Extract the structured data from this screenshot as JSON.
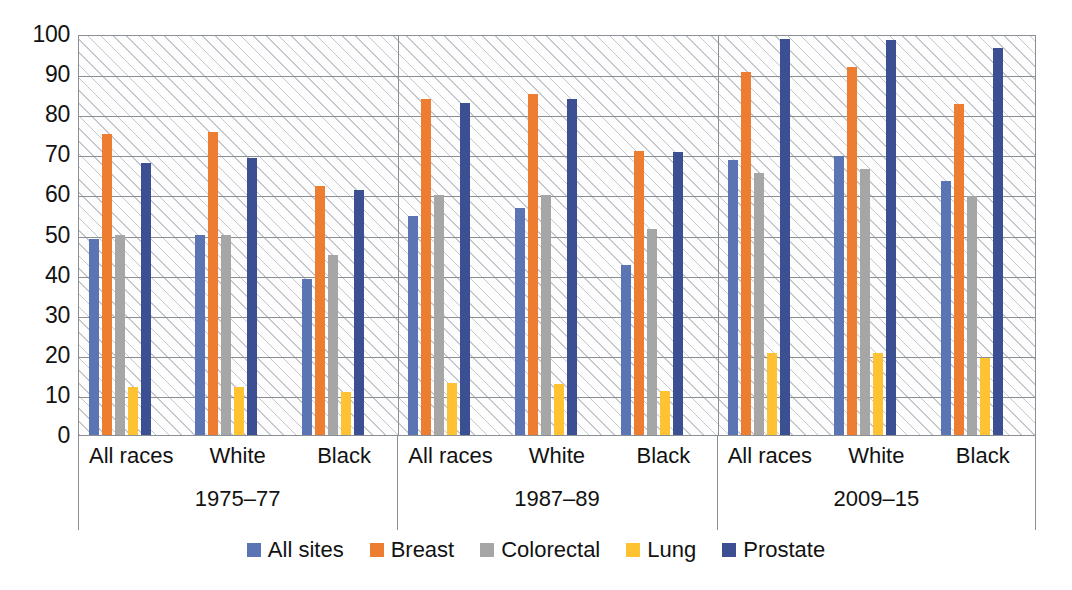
{
  "chart_data": {
    "type": "bar",
    "title": "",
    "subtitle": "",
    "xlabel": "",
    "ylabel": "",
    "ylim": [
      0,
      100
    ],
    "ytick_labels": [
      "100",
      "90",
      "80",
      "70",
      "60",
      "50",
      "40",
      "30",
      "20",
      "10",
      "0"
    ],
    "ytick_values": [
      100,
      90,
      80,
      70,
      60,
      50,
      40,
      30,
      20,
      10,
      0
    ],
    "grid": true,
    "legend_position": "bottom",
    "group_labels": [
      "1975–77",
      "1987–89",
      "2009–15"
    ],
    "categories": [
      "All races",
      "White",
      "Black",
      "All races",
      "White",
      "Black",
      "All races",
      "White",
      "Black"
    ],
    "series": [
      {
        "name": "All sites",
        "color": "#5a74b4",
        "values": [
          49.0,
          49.8,
          39.0,
          54.7,
          56.5,
          42.5,
          68.5,
          69.7,
          63.4
        ]
      },
      {
        "name": "Breast",
        "color": "#ed7d31",
        "values": [
          75.0,
          75.6,
          62.0,
          83.9,
          85.0,
          70.8,
          90.6,
          91.7,
          82.6
        ]
      },
      {
        "name": "Colorectal",
        "color": "#a6a6a6",
        "values": [
          49.8,
          49.8,
          44.9,
          59.8,
          59.9,
          51.5,
          65.4,
          66.3,
          59.6
        ]
      },
      {
        "name": "Lung",
        "color": "#ffc233",
        "values": [
          11.9,
          11.9,
          10.7,
          12.9,
          12.8,
          11.0,
          20.5,
          20.5,
          19.1
        ]
      },
      {
        "name": "Prostate",
        "color": "#3d4f93",
        "values": [
          67.8,
          69.0,
          61.0,
          82.9,
          83.9,
          70.7,
          98.8,
          98.5,
          96.4
        ]
      }
    ],
    "legend_entries": [
      {
        "label": "All sites",
        "color": "#5a74b4"
      },
      {
        "label": "Breast",
        "color": "#ed7d31"
      },
      {
        "label": "Colorectal",
        "color": "#a6a6a6"
      },
      {
        "label": "Lung",
        "color": "#ffc233"
      },
      {
        "label": "Prostate",
        "color": "#3d4f93"
      }
    ]
  },
  "axes": {
    "y_ticks": [
      {
        "label": "100"
      },
      {
        "label": "90"
      },
      {
        "label": "80"
      },
      {
        "label": "70"
      },
      {
        "label": "60"
      },
      {
        "label": "50"
      },
      {
        "label": "40"
      },
      {
        "label": "30"
      },
      {
        "label": "20"
      },
      {
        "label": "10"
      },
      {
        "label": "0"
      }
    ]
  },
  "colors": {
    "all_sites": "#5a74b4",
    "breast": "#ed7d31",
    "colorectal": "#a6a6a6",
    "lung": "#ffc233",
    "prostate": "#3d4f93",
    "grid": "#8a8e95",
    "plot_bg": "#fdfdfe",
    "text": "#121212"
  }
}
